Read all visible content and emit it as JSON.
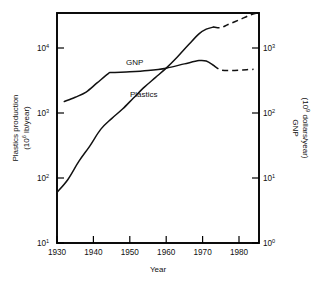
{
  "chart_data": {
    "type": "line",
    "title": "",
    "xlabel": "Year",
    "ylabel": "Plastics production (10⁶ lb/year)",
    "y2label": "GNP (10⁹ dollars/year)",
    "xlim": [
      1928,
      1985
    ],
    "xticks": [
      1930,
      1940,
      1950,
      1960,
      1970,
      1980
    ],
    "xticklabels": [
      "1930",
      "1940",
      "1950",
      "1960",
      "1970",
      "1980"
    ],
    "yscale": "log",
    "ylim": [
      10,
      100000
    ],
    "yticks": [
      10,
      100,
      1000,
      10000
    ],
    "yticklabels": [
      "10¹",
      "10²",
      "10³",
      "10⁴"
    ],
    "y2scale": "log",
    "y2lim": [
      1,
      1000
    ],
    "y2ticks": [
      1,
      10,
      100,
      1000
    ],
    "y2ticklabels": [
      "10⁰",
      "10¹",
      "10²",
      "10³"
    ],
    "grid": false,
    "legend": "inline-annotations",
    "series": [
      {
        "name": "Plastics",
        "axis": "left",
        "units": "10^6 lb/year",
        "solid_points": [
          {
            "year": 1930,
            "value": 60
          },
          {
            "year": 1933,
            "value": 95
          },
          {
            "year": 1936,
            "value": 180
          },
          {
            "year": 1939,
            "value": 310
          },
          {
            "year": 1942,
            "value": 560
          },
          {
            "year": 1945,
            "value": 820
          },
          {
            "year": 1948,
            "value": 1150
          },
          {
            "year": 1951,
            "value": 1700
          },
          {
            "year": 1954,
            "value": 2500
          },
          {
            "year": 1957,
            "value": 3500
          },
          {
            "year": 1960,
            "value": 4900
          },
          {
            "year": 1963,
            "value": 7200
          },
          {
            "year": 1966,
            "value": 11000
          },
          {
            "year": 1969,
            "value": 16500
          },
          {
            "year": 1971,
            "value": 19500
          },
          {
            "year": 1973,
            "value": 21000
          }
        ],
        "dashed_points": [
          {
            "year": 1973,
            "value": 21000
          },
          {
            "year": 1975,
            "value": 20500
          },
          {
            "year": 1977,
            "value": 23000
          },
          {
            "year": 1980,
            "value": 27000
          },
          {
            "year": 1983,
            "value": 32000
          },
          {
            "year": 1985,
            "value": 36000
          }
        ],
        "label": "Plastics",
        "style": "solid-then-dashed"
      },
      {
        "name": "GNP",
        "axis": "right",
        "units": "10^9 dollars/year",
        "solid_points": [
          {
            "year": 1932,
            "value": 150
          },
          {
            "year": 1935,
            "value": 175
          },
          {
            "year": 1938,
            "value": 210
          },
          {
            "year": 1941,
            "value": 290
          },
          {
            "year": 1944,
            "value": 400
          },
          {
            "year": 1945,
            "value": 420
          },
          {
            "year": 1950,
            "value": 430
          },
          {
            "year": 1955,
            "value": 450
          },
          {
            "year": 1960,
            "value": 490
          },
          {
            "year": 1965,
            "value": 570
          },
          {
            "year": 1969,
            "value": 640
          },
          {
            "year": 1971,
            "value": 630
          },
          {
            "year": 1973,
            "value": 540
          }
        ],
        "dashed_points": [
          {
            "year": 1973,
            "value": 540
          },
          {
            "year": 1975,
            "value": 460
          },
          {
            "year": 1978,
            "value": 450
          },
          {
            "year": 1981,
            "value": 460
          },
          {
            "year": 1984,
            "value": 470
          }
        ],
        "label": "GNP",
        "style": "solid-then-dashed"
      }
    ],
    "annotations": [
      {
        "text": "GNP",
        "x": 1952,
        "y_px": 62
      },
      {
        "text": "Plastics",
        "x": 1955,
        "y_px": 94
      }
    ]
  },
  "axes": {
    "left": {
      "title_line1": "Plastics production",
      "title_line2": "(10⁶ lb/year)",
      "title_line2_prefix": "(10",
      "title_line2_exp": "6",
      "title_line2_suffix": " lb/year)",
      "ticks": [
        {
          "base": "10",
          "exp": "4",
          "y": 48
        },
        {
          "base": "10",
          "exp": "3",
          "y": 113
        },
        {
          "base": "10",
          "exp": "2",
          "y": 178
        },
        {
          "base": "10",
          "exp": "1",
          "y": 243
        }
      ]
    },
    "right": {
      "title_line1": "GNP",
      "title_line2_prefix": "(10",
      "title_line2_exp": "9",
      "title_line2_suffix": " dollars/year)",
      "ticks": [
        {
          "base": "10",
          "exp": "3",
          "y": 48
        },
        {
          "base": "10",
          "exp": "2",
          "y": 113
        },
        {
          "base": "10",
          "exp": "1",
          "y": 178
        },
        {
          "base": "10",
          "exp": "0",
          "y": 243
        }
      ]
    },
    "bottom": {
      "title": "Year",
      "ticks": [
        {
          "label": "1930",
          "x": 57
        },
        {
          "label": "1940",
          "x": 93.4
        },
        {
          "label": "1950",
          "x": 129.8
        },
        {
          "label": "1960",
          "x": 166.2
        },
        {
          "label": "1970",
          "x": 202.6
        },
        {
          "label": "1980",
          "x": 239
        }
      ]
    }
  },
  "curve_labels": {
    "gnp": "GNP",
    "plastics": "Plastics"
  },
  "colors": {
    "ink": "#111111",
    "frame": "#000000",
    "background": "#ffffff"
  },
  "geometry": {
    "plot_left": 57,
    "plot_right": 259,
    "plot_top": 13,
    "plot_bottom": 243
  }
}
